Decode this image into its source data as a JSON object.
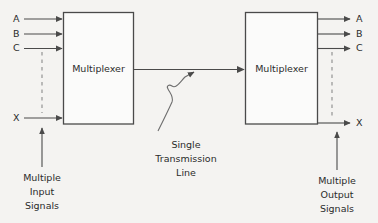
{
  "diagram": {
    "background_color": "#f4f3f1",
    "line_color": "#4a4a4a",
    "text_color": "#2b2b2b",
    "blocks": [
      {
        "id": "left-mux",
        "label": "Multiplexer"
      },
      {
        "id": "right-mux",
        "label": "Multiplexer"
      }
    ],
    "input_signals": [
      {
        "name": "A"
      },
      {
        "name": "B"
      },
      {
        "name": "C"
      }
    ],
    "input_last_signal": {
      "name": "X"
    },
    "output_signals": [
      {
        "name": "A"
      },
      {
        "name": "B"
      },
      {
        "name": "C"
      }
    ],
    "output_last_signal": {
      "name": "X"
    },
    "left_caption": {
      "line1": "Multiple",
      "line2": "Input",
      "line3": "Signals"
    },
    "center_caption": {
      "line1": "Single",
      "line2": "Transmission",
      "line3": "Line"
    },
    "right_caption": {
      "line1": "Multiple",
      "line2": "Output",
      "line3": "Signals"
    },
    "icons": {
      "arrow_right": "arrow-right-icon",
      "arrow_up": "arrow-up-icon",
      "dashed_continuation": "vertical-dashed-line-icon",
      "squiggly_pointer": "squiggly-arrow-icon"
    }
  }
}
